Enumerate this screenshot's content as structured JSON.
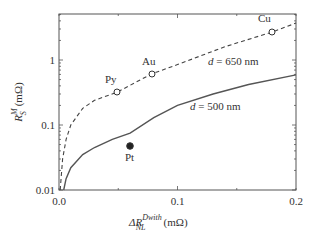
{
  "chart_data": {
    "type": "line",
    "title": "",
    "xlabel": "ΔR_NL^Dwith (mΩ)",
    "ylabel": "R_S^M (mΩ)",
    "xlabel_parts": {
      "delta": "ΔR",
      "sup": "Dwith",
      "sub": "NL",
      "unit": "(mΩ)"
    },
    "ylabel_parts": {
      "base": "R",
      "sup": "M",
      "sub": "S",
      "unit": "(mΩ)"
    },
    "xlim": [
      0,
      0.2
    ],
    "ylim": [
      0.01,
      5
    ],
    "yscale": "log",
    "grid": false,
    "x_ticks": [
      {
        "value": 0.0,
        "label": "0.0"
      },
      {
        "value": 0.1,
        "label": "0.1"
      },
      {
        "value": 0.2,
        "label": "0.2"
      }
    ],
    "y_ticks": [
      {
        "value": 0.01,
        "label": "0.01"
      },
      {
        "value": 0.1,
        "label": "0.1"
      },
      {
        "value": 1,
        "label": "1"
      }
    ],
    "series": [
      {
        "name": "d = 650 nm",
        "style": "dashed",
        "label_d": "d",
        "label_rest": " = 650 nm",
        "x": [
          0.001,
          0.003,
          0.006,
          0.01,
          0.02,
          0.03,
          0.049,
          0.078,
          0.1,
          0.14,
          0.18,
          0.2
        ],
        "y": [
          0.01,
          0.03,
          0.06,
          0.1,
          0.18,
          0.24,
          0.32,
          0.61,
          0.85,
          1.6,
          2.7,
          3.7
        ]
      },
      {
        "name": "d = 500 nm",
        "style": "solid",
        "label_d": "d",
        "label_rest": " = 500 nm",
        "x": [
          0.004,
          0.006,
          0.01,
          0.02,
          0.03,
          0.045,
          0.06,
          0.08,
          0.1,
          0.13,
          0.16,
          0.2
        ],
        "y": [
          0.01,
          0.015,
          0.022,
          0.035,
          0.045,
          0.06,
          0.075,
          0.13,
          0.2,
          0.3,
          0.42,
          0.59
        ]
      }
    ],
    "points": [
      {
        "label": "Py",
        "x": 0.049,
        "y": 0.32,
        "marker": "open-circle",
        "series": "d = 650 nm"
      },
      {
        "label": "Au",
        "x": 0.078,
        "y": 0.61,
        "marker": "open-circle",
        "series": "d = 650 nm"
      },
      {
        "label": "Cu",
        "x": 0.18,
        "y": 2.7,
        "marker": "open-circle",
        "series": "d = 650 nm"
      },
      {
        "label": "Pt",
        "x": 0.06,
        "y": 0.13,
        "marker": "filled-circle",
        "series": "d = 500 nm"
      }
    ]
  }
}
